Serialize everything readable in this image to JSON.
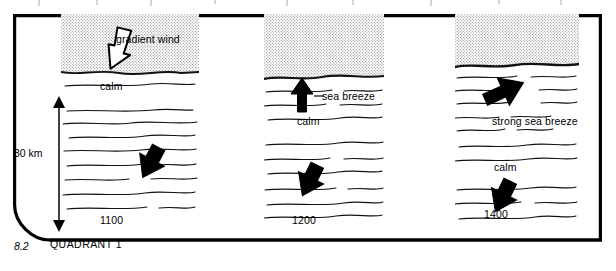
{
  "figure": {
    "number": "8.2",
    "caption": "QUADRANT 1",
    "scale_label": "30 km",
    "frame_color": "#000000",
    "stipple_color": "#9a9a9a",
    "arrow_fill_solid": "#000000",
    "arrow_fill_outline": "#ffffff"
  },
  "panels": [
    {
      "id": "panel-1",
      "time_label": "1100",
      "stipple_depth_label": "deep",
      "labels": {
        "upper_arrow": "gradient wind",
        "mid": "calm"
      },
      "arrows": [
        {
          "name": "gradient-wind-arrow",
          "style": "outline",
          "direction": "down-right"
        },
        {
          "name": "subsidence-arrow",
          "style": "solid",
          "direction": "down-right"
        }
      ]
    },
    {
      "id": "panel-2",
      "time_label": "1200",
      "stipple_depth_label": "medium",
      "labels": {
        "upper_arrow": "sea breeze",
        "mid": "calm"
      },
      "arrows": [
        {
          "name": "sea-breeze-arrow",
          "style": "solid",
          "direction": "up"
        },
        {
          "name": "subsidence-arrow",
          "style": "solid",
          "direction": "down-right"
        }
      ]
    },
    {
      "id": "panel-3",
      "time_label": "1400",
      "stipple_depth_label": "shallow",
      "labels": {
        "upper_arrow": "strong sea breeze",
        "mid": "calm"
      },
      "arrows": [
        {
          "name": "strong-sea-breeze-arrow",
          "style": "solid",
          "direction": "up-right"
        },
        {
          "name": "subsidence-arrow",
          "style": "solid",
          "direction": "down-right"
        }
      ]
    }
  ]
}
